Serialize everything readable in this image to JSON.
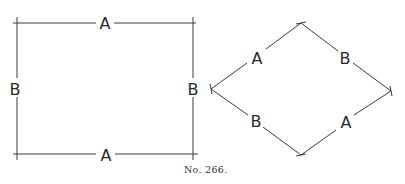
{
  "figure": {
    "caption": "No. 266.",
    "rectangle": {
      "top_label": "A",
      "bottom_label": "A",
      "left_label": "B",
      "right_label": "B"
    },
    "diamond": {
      "upper_left_label": "A",
      "upper_right_label": "B",
      "lower_left_label": "B",
      "lower_right_label": "A"
    },
    "line_color": "#3a3a3a",
    "text_color": "#2a2a2a"
  }
}
